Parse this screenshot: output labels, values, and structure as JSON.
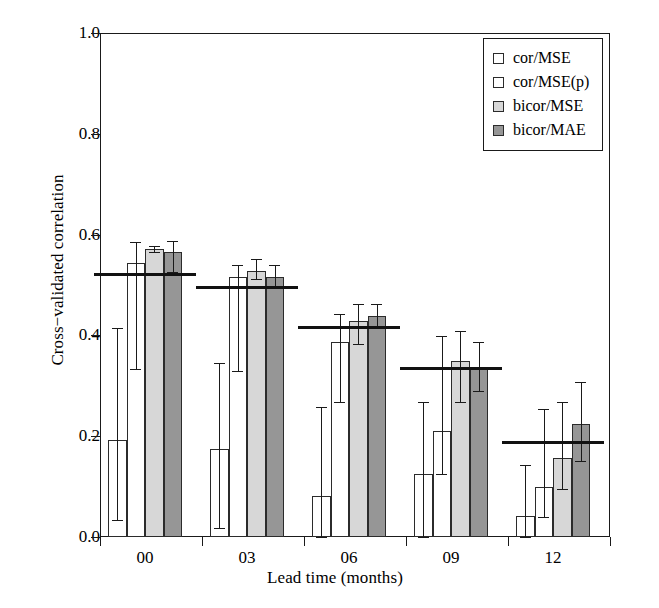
{
  "chart_data": {
    "type": "bar",
    "title": "",
    "xlabel": "Lead time (months)",
    "ylabel": "Cross−validated correlation",
    "categories": [
      "00",
      "03",
      "06",
      "09",
      "12"
    ],
    "ylim": [
      0.0,
      1.0
    ],
    "ytick_labels": [
      "0.0",
      "0.2",
      "0.4",
      "0.6",
      "0.8",
      "1.0"
    ],
    "ytick_values": [
      0.0,
      0.2,
      0.4,
      0.6,
      0.8,
      1.0
    ],
    "grid": false,
    "legend_position": "top-right",
    "series": [
      {
        "name": "cor/MSE",
        "swatch": "white",
        "values": [
          0.193,
          0.175,
          0.081,
          0.125,
          0.042
        ],
        "err_low": [
          0.034,
          0.018,
          0.0,
          0.0,
          0.0
        ],
        "err_high": [
          0.415,
          0.345,
          0.258,
          0.268,
          0.142
        ]
      },
      {
        "name": "cor/MSE(p)",
        "swatch": "white",
        "values": [
          0.543,
          0.515,
          0.386,
          0.21,
          0.1
        ],
        "err_low": [
          0.334,
          0.33,
          0.268,
          0.125,
          0.04
        ],
        "err_high": [
          0.585,
          0.54,
          0.442,
          0.398,
          0.253
        ]
      },
      {
        "name": "bicor/MSE",
        "swatch": "light-gray",
        "values": [
          0.571,
          0.528,
          0.428,
          0.35,
          0.157
        ],
        "err_low": [
          0.565,
          0.512,
          0.383,
          0.268,
          0.095
        ],
        "err_high": [
          0.578,
          0.552,
          0.462,
          0.408,
          0.268
        ]
      },
      {
        "name": "bicor/MAE",
        "swatch": "dark-gray",
        "values": [
          0.566,
          0.516,
          0.438,
          0.338,
          0.225
        ],
        "err_low": [
          0.525,
          0.497,
          0.415,
          0.29,
          0.15
        ],
        "err_high": [
          0.588,
          0.54,
          0.462,
          0.387,
          0.308
        ]
      }
    ],
    "reference_lines": [
      {
        "category": "00",
        "value": 0.524
      },
      {
        "category": "03",
        "value": 0.498
      },
      {
        "category": "06",
        "value": 0.418
      },
      {
        "category": "09",
        "value": 0.338
      },
      {
        "category": "12",
        "value": 0.19
      }
    ],
    "colors": {
      "white": "#ffffff",
      "light_gray": "#d7d7d7",
      "dark_gray": "#969696",
      "axis": "#1a1a1a",
      "reference_line": "#111111"
    }
  }
}
